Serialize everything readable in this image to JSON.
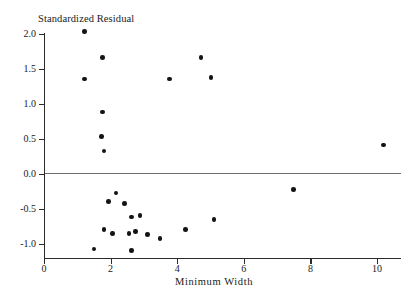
{
  "chart_data": {
    "type": "scatter",
    "title": "Standardized Residual",
    "xlabel": "Minimum Width",
    "ylabel": "",
    "xlim": [
      0,
      10.72
    ],
    "ylim": [
      -1.22,
      2.22
    ],
    "grid": false,
    "legend": "none",
    "annotations": [
      {
        "type": "reference-line",
        "axis": "y",
        "value": 0.0,
        "style": "solid-gray"
      }
    ],
    "xticks": [
      0,
      2,
      4,
      6,
      8,
      10
    ],
    "xtick_labels": [
      "0",
      "2",
      "4",
      "6",
      "8",
      "10"
    ],
    "yticks": [
      2.0,
      1.5,
      1.0,
      0.5,
      0.0,
      -0.5,
      -1.0
    ],
    "ytick_labels": [
      "2.0",
      "1.5",
      "1.0",
      "0.5",
      "0.0",
      "-0.5",
      "-1.0"
    ],
    "points": [
      {
        "x": 1.22,
        "y": 2.03
      },
      {
        "x": 1.75,
        "y": 1.66
      },
      {
        "x": 1.22,
        "y": 1.35
      },
      {
        "x": 1.76,
        "y": 0.88
      },
      {
        "x": 1.72,
        "y": 0.53
      },
      {
        "x": 1.8,
        "y": 0.32
      },
      {
        "x": 4.72,
        "y": 1.66
      },
      {
        "x": 3.77,
        "y": 1.35
      },
      {
        "x": 5.02,
        "y": 1.37
      },
      {
        "x": 10.2,
        "y": 0.41
      },
      {
        "x": 2.16,
        "y": -0.28
      },
      {
        "x": 1.93,
        "y": -0.4
      },
      {
        "x": 2.42,
        "y": -0.43
      },
      {
        "x": 2.62,
        "y": -0.62
      },
      {
        "x": 2.88,
        "y": -0.6
      },
      {
        "x": 5.1,
        "y": -0.66
      },
      {
        "x": 4.25,
        "y": -0.8
      },
      {
        "x": 1.8,
        "y": -0.8
      },
      {
        "x": 2.05,
        "y": -0.86
      },
      {
        "x": 2.55,
        "y": -0.86
      },
      {
        "x": 2.75,
        "y": -0.83
      },
      {
        "x": 3.1,
        "y": -0.87
      },
      {
        "x": 3.48,
        "y": -0.93
      },
      {
        "x": 1.5,
        "y": -1.08
      },
      {
        "x": 2.62,
        "y": -1.1
      },
      {
        "x": 7.5,
        "y": -0.23
      }
    ]
  }
}
